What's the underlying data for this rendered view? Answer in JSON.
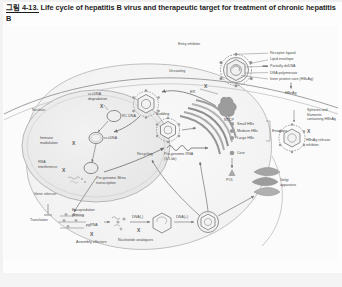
{
  "caption": {
    "fignum": "그림 4-13.",
    "text": " Life cycle of hepatitis B virus and therapeutic target for treatment of chronic hepatitis B"
  },
  "diagram": {
    "title": "Life cycle of hepatitis B virus and therapeutic target for treatment of chronic hepatitis B",
    "type": "biological-pathway-schematic",
    "colors": {
      "line": "#6e6e6e",
      "text": "#4a4a4a",
      "cell_fill": "#f7f7f7",
      "nucleus_fill": "#efefef",
      "organelle": "#b8b8b8",
      "background": "#fbfbfb"
    },
    "virion_legend": [
      {
        "id": "receptor-ligand",
        "label": "Receptor ligand"
      },
      {
        "id": "lipid-envelope",
        "label": "Lipid envelope"
      },
      {
        "id": "partially-dsdna",
        "label": "Partially dsDNA"
      },
      {
        "id": "dna-polymerase",
        "label": "DNA polymerase"
      },
      {
        "id": "inner-protein-core",
        "label": "Inner protein core (HBcAg)"
      }
    ],
    "secreted_products": [
      {
        "id": "hbeag",
        "label": "HBeAg"
      },
      {
        "id": "spheres-filaments",
        "label": "Spheres and filaments containing HBsAg"
      }
    ],
    "envelope_proteins": {
      "items": [
        "Small HBs",
        "Medium HBs",
        "Large HBs"
      ],
      "bracket_label": "Envelope"
    },
    "core_proteins": [
      {
        "id": "core",
        "label": "Core"
      },
      {
        "id": "pol",
        "label": "POL"
      }
    ],
    "process_labels": [
      {
        "id": "uncoating",
        "label": "Uncoating"
      },
      {
        "id": "recycling",
        "label": "Recycling"
      },
      {
        "id": "budding",
        "label": "Budding"
      },
      {
        "id": "er",
        "label": "ER"
      },
      {
        "id": "golgi",
        "label": "Golgi apparatus"
      },
      {
        "id": "nucleus",
        "label": "Nucleus"
      },
      {
        "id": "ntcp",
        "label": "NTCP"
      },
      {
        "id": "translation",
        "label": "Translation"
      },
      {
        "id": "pre-genomic-transcription",
        "label": "Pre-genomic Mrna transcription"
      }
    ],
    "nucleic_acid_species": [
      {
        "id": "cccdna",
        "label": "cccDNA"
      },
      {
        "id": "rc-dna",
        "label": "RC DNA"
      },
      {
        "id": "pgrna",
        "label": "pgRNA"
      },
      {
        "id": "pre-genomic-rna",
        "label": "Pre-genomic RNA (3.5 kb)"
      },
      {
        "id": "dna-minus",
        "label": "DNA(-)"
      },
      {
        "id": "dna-plus",
        "label": "DNA(+)"
      }
    ],
    "therapeutic_targets": [
      {
        "id": "entry-inhibitor",
        "label": "Entry inhibitor",
        "marker": "X"
      },
      {
        "id": "hbsag-release-inhibitor",
        "label": "HBsAg release inhibitor",
        "marker": "X"
      },
      {
        "id": "cccdna-degradation",
        "label": "cccDNA degradation",
        "marker": "X"
      },
      {
        "id": "immune-modulation",
        "label": "Immune modulation",
        "marker": "X"
      },
      {
        "id": "rna-interference",
        "label": "RNA interference",
        "marker": "X"
      },
      {
        "id": "gene-silencer",
        "label": "Gene silencer",
        "marker": "X"
      },
      {
        "id": "encapsidation-priming",
        "label": "Encapsidation priming",
        "marker": "X"
      },
      {
        "id": "assembly-effectors",
        "label": "Assembly effectors",
        "marker": "X"
      },
      {
        "id": "nucleotide-analogues",
        "label": "Nucleotide analogues",
        "marker": "X"
      }
    ]
  }
}
